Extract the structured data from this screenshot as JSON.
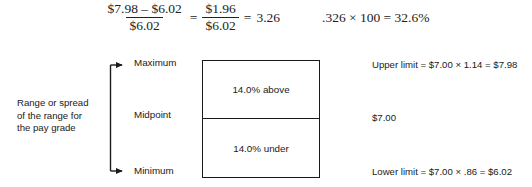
{
  "equation": {
    "numerator_1": "$7.98 – $6.02",
    "denominator_1": "$6.02",
    "equals_1": "=",
    "numerator_2": "$1.96",
    "denominator_2": "$6.02",
    "equals_2": "=",
    "result_1": "3.26",
    "second_statement": ".326 × 100 = 32.6%"
  },
  "diagram": {
    "left_caption": {
      "line1": "Range or spread",
      "line2": "of the range for",
      "line3": "the pay grade"
    },
    "axis_labels": {
      "maximum": "Maximum",
      "midpoint": "Midpoint",
      "minimum": "Minimum"
    },
    "box": {
      "top_cell": "14.0% above",
      "bottom_cell": "14.0% under"
    },
    "right_notes": {
      "upper_limit": "Upper limit = $7.00 × 1.14 = $7.98",
      "midpoint_value": "$7.00",
      "lower_limit": "Lower limit = $7.00 × .86 = $6.02"
    }
  },
  "colors": {
    "ink": "#1a1a1a",
    "background": "#ffffff"
  }
}
